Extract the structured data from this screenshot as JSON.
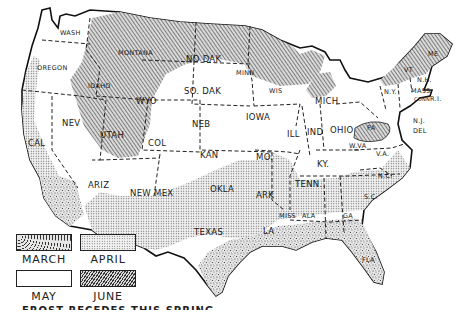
{
  "map": {
    "title": "US frost map by month of last spring frost",
    "states": [
      {
        "abbr": "WASH",
        "period": "MAY"
      },
      {
        "abbr": "OREGON",
        "period": "MAY"
      },
      {
        "abbr": "CAL",
        "period": "APRIL"
      },
      {
        "abbr": "NEV",
        "period": "JUNE"
      },
      {
        "abbr": "IDAHO",
        "period": "JUNE"
      },
      {
        "abbr": "MONTANA",
        "period": "JUNE"
      },
      {
        "abbr": "WYO",
        "period": "JUNE"
      },
      {
        "abbr": "UTAH",
        "period": "JUNE"
      },
      {
        "abbr": "COL",
        "period": "MAY"
      },
      {
        "abbr": "ARIZ",
        "period": "APRIL"
      },
      {
        "abbr": "NEW MEX",
        "period": "APRIL"
      },
      {
        "abbr": "NO DAK",
        "period": "JUNE"
      },
      {
        "abbr": "SO. DAK",
        "period": "MAY"
      },
      {
        "abbr": "NEB",
        "period": "MAY"
      },
      {
        "abbr": "KAN",
        "period": "MAY"
      },
      {
        "abbr": "OKLA",
        "period": "APRIL"
      },
      {
        "abbr": "TEXAS",
        "period": "APRIL"
      },
      {
        "abbr": "MINN",
        "period": "JUNE"
      },
      {
        "abbr": "IOWA",
        "period": "MAY"
      },
      {
        "abbr": "MO.",
        "period": "MAY"
      },
      {
        "abbr": "ARK",
        "period": "APRIL"
      },
      {
        "abbr": "LA",
        "period": "MARCH"
      },
      {
        "abbr": "WIS",
        "period": "JUNE"
      },
      {
        "abbr": "ILL",
        "period": "MAY"
      },
      {
        "abbr": "MICH",
        "period": "MAY"
      },
      {
        "abbr": "IND",
        "period": "MAY"
      },
      {
        "abbr": "OHIO",
        "period": "MAY"
      },
      {
        "abbr": "KY.",
        "period": "MAY"
      },
      {
        "abbr": "TENN.",
        "period": "MAY"
      },
      {
        "abbr": "MISS",
        "period": "APRIL"
      },
      {
        "abbr": "ALA",
        "period": "APRIL"
      },
      {
        "abbr": "GA",
        "period": "APRIL"
      },
      {
        "abbr": "FLA",
        "period": "MARCH"
      },
      {
        "abbr": "S.C.",
        "period": "APRIL"
      },
      {
        "abbr": "N.C.",
        "period": "APRIL"
      },
      {
        "abbr": "VA",
        "period": "MAY"
      },
      {
        "abbr": "W.VA",
        "period": "MAY"
      },
      {
        "abbr": "PA",
        "period": "JUNE"
      },
      {
        "abbr": "N.Y.",
        "period": "MAY"
      },
      {
        "abbr": "N.J.",
        "period": "MAY"
      },
      {
        "abbr": "DEL",
        "period": "MAY"
      },
      {
        "abbr": "VT",
        "period": "JUNE"
      },
      {
        "abbr": "N.H.",
        "period": "MAY"
      },
      {
        "abbr": "MASS",
        "period": "MAY"
      },
      {
        "abbr": "CONN",
        "period": "MAY"
      },
      {
        "abbr": "R.I.",
        "period": "MAY"
      },
      {
        "abbr": "ME",
        "period": "JUNE"
      }
    ],
    "labels": {
      "wash": "WASH",
      "oregon": "OREGON",
      "cal": "CAL",
      "nev": "NEV",
      "idaho": "IDAHO",
      "montana": "MONTANA",
      "wyo": "WYO",
      "utah": "UTAH",
      "col": "COL",
      "ariz": "ARIZ",
      "newmex": "NEW MEX",
      "nodak": "NO DAK",
      "sodak": "SO. DAK",
      "neb": "NEB",
      "kan": "KAN",
      "okla": "OKLA",
      "texas": "TEXAS",
      "minn": "MINN",
      "iowa": "IOWA",
      "mo": "MO.",
      "ark": "ARK",
      "la": "LA",
      "wis": "WIS",
      "ill": "ILL",
      "mich": "MICH",
      "ind": "IND",
      "ohio": "OHIO",
      "ky": "KY.",
      "tenn": "TENN.",
      "miss": "MISS",
      "ala": "ALA",
      "ga": "GA",
      "fla": "FLA",
      "sc": "S.C.",
      "nc": "N.C.",
      "va": "V.A.",
      "wva": "W.VA",
      "pa": "PA",
      "ny": "N.Y.",
      "nj": "N.J.",
      "del": "DEL",
      "vt": "VT",
      "nh": "N.H.",
      "mass": "MASS",
      "conn": "CONN",
      "ri": "R.I.",
      "me": "ME"
    }
  },
  "legend": {
    "items": [
      {
        "label": "MARCH",
        "pattern": "coarse-stipple"
      },
      {
        "label": "APRIL",
        "pattern": "fine-dot"
      },
      {
        "label": "MAY",
        "pattern": "blank"
      },
      {
        "label": "JUNE",
        "pattern": "diagonal-hatch"
      }
    ]
  },
  "caption": "FROST RECEDES THIS SPRING"
}
